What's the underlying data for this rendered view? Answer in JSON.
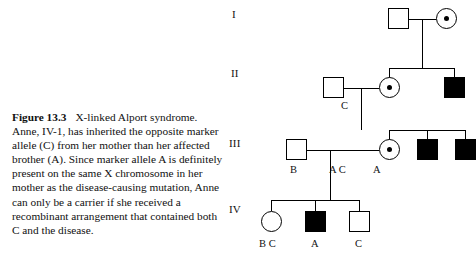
{
  "figure": {
    "number_label": "Figure 13.3",
    "title": "X-linked Alport syndrome.",
    "caption_lines": [
      "Anne, IV-1, has inherited the opposite marker",
      "allele (C) from her mother than her affected",
      "brother (A). Since marker allele A is definitely",
      "present on the same X chromosome in her",
      "mother as the disease-causing mutation, Anne",
      "can only be a carrier if she received a",
      "recombinant arrangement that contained both",
      "C and the disease."
    ]
  },
  "pedigree": {
    "generations": [
      {
        "id": "gen-1",
        "label": "I"
      },
      {
        "id": "gen-2",
        "label": "II"
      },
      {
        "id": "gen-3",
        "label": "III"
      },
      {
        "id": "gen-4",
        "label": "IV"
      }
    ],
    "individuals": [
      {
        "id": "I-1",
        "generation": "I",
        "sex": "male",
        "symbol": "square",
        "status": "unaffected",
        "alleles": ""
      },
      {
        "id": "I-2",
        "generation": "I",
        "sex": "female",
        "symbol": "circle",
        "status": "carrier",
        "alleles": ""
      },
      {
        "id": "II-1",
        "generation": "II",
        "sex": "male",
        "symbol": "square",
        "status": "unaffected",
        "alleles": "C"
      },
      {
        "id": "II-2",
        "generation": "II",
        "sex": "female",
        "symbol": "circle",
        "status": "carrier",
        "alleles": ""
      },
      {
        "id": "II-3",
        "generation": "II",
        "sex": "male",
        "symbol": "square",
        "status": "affected",
        "alleles": ""
      },
      {
        "id": "III-1",
        "generation": "III",
        "sex": "male",
        "symbol": "square",
        "status": "unaffected",
        "alleles": "B"
      },
      {
        "id": "III-2",
        "generation": "III",
        "sex": "female",
        "symbol": "circle",
        "status": "carrier",
        "alleles": "A C"
      },
      {
        "id": "III-3",
        "generation": "III",
        "sex": "male",
        "symbol": "square",
        "status": "affected",
        "alleles": "A"
      },
      {
        "id": "III-4",
        "generation": "III",
        "sex": "male",
        "symbol": "square",
        "status": "affected",
        "alleles": ""
      },
      {
        "id": "IV-1",
        "generation": "IV",
        "sex": "female",
        "symbol": "circle",
        "status": "unaffected",
        "alleles": "B C"
      },
      {
        "id": "IV-2",
        "generation": "IV",
        "sex": "male",
        "symbol": "square",
        "status": "affected",
        "alleles": "A"
      },
      {
        "id": "IV-3",
        "generation": "IV",
        "sex": "male",
        "symbol": "square",
        "status": "unaffected",
        "alleles": "C"
      }
    ],
    "allele_labels": {
      "gen2_male": "C",
      "gen3_male": "B",
      "gen3_female": "A C",
      "gen3_affected": "A",
      "gen4_female": "B C",
      "gen4_affected": "A",
      "gen4_male": "C"
    }
  },
  "colors": {
    "line": "#000000",
    "affected_fill": "#000000",
    "unaffected_fill": "#ffffff",
    "text": "#111111"
  }
}
